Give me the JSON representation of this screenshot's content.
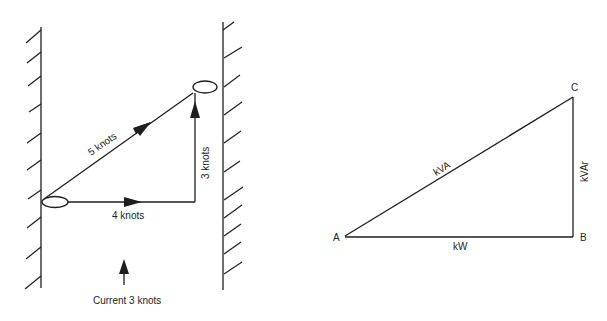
{
  "figure_left": {
    "title": "Boat crossing river vector diagram",
    "labels": {
      "resultant": "5 knots",
      "boat_speed": "4 knots",
      "current_component": "3 knots",
      "current": "Current 3 knots"
    },
    "vectors": [
      {
        "name": "resultant",
        "magnitude_knots": 5,
        "direction": "diagonal up-right"
      },
      {
        "name": "boat",
        "magnitude_knots": 4,
        "direction": "across (right)"
      },
      {
        "name": "current",
        "magnitude_knots": 3,
        "direction": "upstream (up)"
      }
    ]
  },
  "figure_right": {
    "title": "Power triangle",
    "vertices": {
      "a": "A",
      "b": "B",
      "c": "C"
    },
    "sides": {
      "hypotenuse": "kVA",
      "base": "kW",
      "vertical": "kVAr"
    }
  },
  "colors": {
    "ink": "#1e1e1e",
    "background": "#ffffff"
  }
}
